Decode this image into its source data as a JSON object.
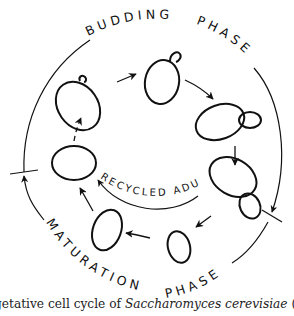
{
  "diagram": {
    "phases": {
      "budding": "BUDDING PHASE",
      "budding_word1": "BUDDING",
      "budding_word2": "PHASE",
      "maturation": "MATURATION PHASE",
      "maturation_word1": "MATURATION",
      "maturation_word2": "PHASE"
    },
    "inner_label": "RECYCLED ADULT",
    "cells": [
      {
        "id": "cell-1",
        "stage": "small bud emerging (top-left)"
      },
      {
        "id": "cell-2",
        "stage": "bud growing (top)"
      },
      {
        "id": "cell-3",
        "stage": "large bud (right)"
      },
      {
        "id": "cell-4",
        "stage": "mother and daughter separating (right-lower)"
      },
      {
        "id": "cell-5",
        "stage": "small daughter cell (bottom)"
      },
      {
        "id": "cell-6",
        "stage": "maturing daughter (bottom-left)"
      },
      {
        "id": "cell-7",
        "stage": "mature adult cell (left)"
      }
    ],
    "colors": {
      "line": "#111111",
      "background": "#ffffff"
    }
  },
  "caption": {
    "prefix": "getative cell cycle of ",
    "species": "Saccharomyces cerevisiae",
    "suffix": " (redrawn fi"
  }
}
